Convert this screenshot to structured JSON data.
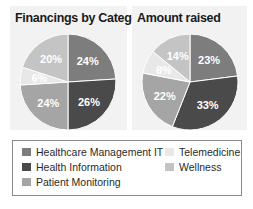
{
  "chart_data": [
    {
      "type": "pie",
      "title": "Financings by Category",
      "categories": [
        "Healthcare Management IT",
        "Health Information",
        "Patient Monitoring",
        "Telemedicine",
        "Wellness"
      ],
      "values": [
        24,
        26,
        24,
        6,
        20
      ],
      "labels": [
        "24%",
        "26%",
        "24%",
        "6%",
        "20%"
      ],
      "colors": [
        "#7d7d7d",
        "#4a4a4a",
        "#a5a5a5",
        "#e8e8e8",
        "#c4c4c4"
      ],
      "start": "12 o'clock, clockwise"
    },
    {
      "type": "pie",
      "title": "Amount raised",
      "categories": [
        "Healthcare Management IT",
        "Health Information",
        "Patient Monitoring",
        "Telemedicine",
        "Wellness"
      ],
      "values": [
        23,
        33,
        22,
        8,
        14
      ],
      "labels": [
        "23%",
        "33%",
        "22%",
        "8%",
        "14%"
      ],
      "colors": [
        "#7d7d7d",
        "#4a4a4a",
        "#a5a5a5",
        "#e8e8e8",
        "#c4c4c4"
      ],
      "start": "12 o'clock, clockwise"
    }
  ],
  "legend": {
    "position": "bottom",
    "items": [
      {
        "label": "Healthcare Management IT",
        "color": "#7d7d7d"
      },
      {
        "label": "Health Information",
        "color": "#4a4a4a"
      },
      {
        "label": "Patient Monitoring",
        "color": "#a5a5a5"
      },
      {
        "label": "Telemedicine",
        "color": "#e8e8e8"
      },
      {
        "label": "Wellness",
        "color": "#c4c4c4"
      }
    ]
  }
}
